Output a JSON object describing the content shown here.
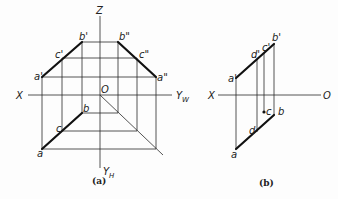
{
  "figure_a": {
    "caption": "(a)",
    "axes": {
      "x": "X",
      "z": "Z",
      "yw": "Y",
      "yw_sub": "W",
      "yh": "Y",
      "yh_sub": "H",
      "origin": "O"
    },
    "points": {
      "a_prime": "a'",
      "b_prime": "b'",
      "c_prime": "c'",
      "a_dprime": "a\"",
      "b_dprime": "b\"",
      "c_dprime": "c\"",
      "a": "a",
      "b": "b",
      "c": "c"
    }
  },
  "figure_b": {
    "caption": "(b)",
    "axes": {
      "x": "X",
      "origin": "O"
    },
    "points": {
      "a_prime": "a'",
      "b_prime": "b'",
      "c_prime": "c'",
      "d_prime": "d'",
      "a": "a",
      "b": "b",
      "c": "c",
      "d": "d"
    }
  }
}
